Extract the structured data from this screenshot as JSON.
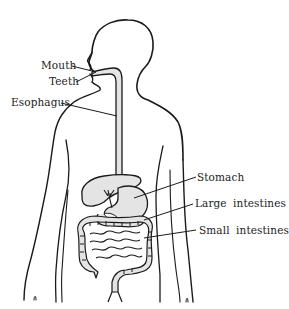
{
  "diagram": {
    "colors": {
      "outline": "#1a1a1a",
      "organ_fill": "#e4e4e4",
      "background": "#ffffff",
      "text": "#222222"
    },
    "labels": [
      {
        "id": "mouth",
        "text": "Mouth",
        "points_to": "mouth"
      },
      {
        "id": "teeth",
        "text": "Teeth",
        "points_to": "teeth"
      },
      {
        "id": "esophagus",
        "text": "Esophagus",
        "points_to": "esophagus"
      },
      {
        "id": "stomach",
        "text": "Stomach",
        "points_to": "stomach"
      },
      {
        "id": "large_intestines",
        "text": "Large intestines",
        "points_to": "large intestine"
      },
      {
        "id": "small_intestines",
        "text": "Small intestines",
        "points_to": "small intestine"
      }
    ]
  }
}
